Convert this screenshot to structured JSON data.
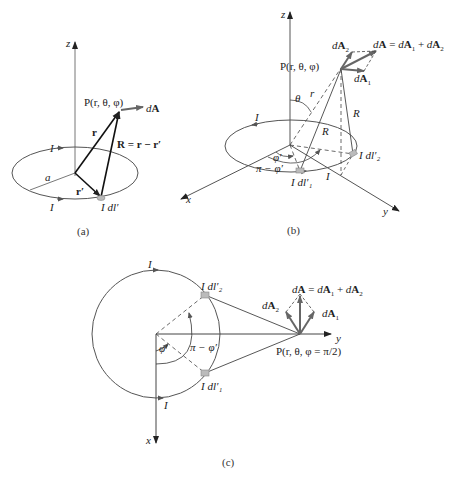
{
  "panels": {
    "a": {
      "caption": "(a)",
      "axis_z": "z",
      "point_label": "P(r, θ, φ)",
      "vec_dA": "dA",
      "vec_r": "r",
      "vec_R": "R = r − r′",
      "vec_rprime": "r′",
      "radius": "a",
      "current_top": "I",
      "current_bottom": "I",
      "element": "I dl′"
    },
    "b": {
      "caption": "(b)",
      "axis_z": "z",
      "axis_x": "x",
      "axis_y": "y",
      "point_label": "P(r, θ, φ)",
      "sum_label": "dA = dA₁ + dA₂",
      "dA1": "dA₁",
      "dA2": "dA₂",
      "theta": "θ",
      "r": "r",
      "R_left": "R",
      "R_right": "R",
      "phi_prime": "φ′",
      "pi_minus_phi": "π − φ′",
      "current_top": "I",
      "current_bottom": "I",
      "element1": "I dl′₁",
      "element2": "I dl′₂"
    },
    "c": {
      "caption": "(c)",
      "axis_x": "x",
      "axis_y": "y",
      "point_label": "P(r, θ, φ = π/2)",
      "sum_label": "dA = dA₁ + dA₂",
      "dA1": "dA₁",
      "dA2": "dA₂",
      "phi_prime": "φ′",
      "pi_minus_phi": "π − φ′",
      "current_top": "I",
      "current_bottom": "I",
      "element1": "I dl′₁",
      "element2": "I dl′₂"
    }
  },
  "colors": {
    "line": "#333333",
    "loop": "#555555",
    "vector": "#666666",
    "element": "#bbbbbb"
  }
}
